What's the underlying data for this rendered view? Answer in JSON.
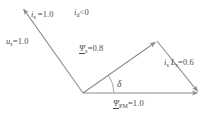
{
  "diagram": {
    "background_color": "#ffffff",
    "line_color": "#8c8c8c",
    "text_color": "#4a4a4a",
    "labels": {
      "u_s": {
        "symbol": "u",
        "subscript": "s",
        "relation": "=",
        "value": "1.0",
        "text": "u"
      },
      "i_s_top": {
        "symbol": "i",
        "subscript": "s",
        "relation": "=",
        "value": "1.0",
        "text": "i"
      },
      "i_d": {
        "symbol": "i",
        "subscript": "d",
        "relation": "<",
        "value": "0",
        "text": "i"
      },
      "psi_s": {
        "symbol": "Ψ",
        "subscript": "s",
        "relation": "=",
        "value": "0.8",
        "text": "Ψ"
      },
      "is_ls": {
        "symbol_1": "i",
        "subscript_1": "s",
        "symbol_2": "L",
        "subscript_2": "s",
        "relation": "=",
        "value": "0.6"
      },
      "psi_pm": {
        "symbol": "Ψ",
        "subscript": "PM",
        "relation": "=",
        "value": "1.0",
        "text": "Ψ"
      },
      "delta": {
        "symbol": "δ"
      }
    },
    "vectors": [
      {
        "name": "u_s",
        "from": [
          83,
          93
        ],
        "to": [
          22,
          7
        ],
        "arrow_at": "to"
      },
      {
        "name": "psi_s",
        "from": [
          83,
          93
        ],
        "to": [
          157,
          41
        ],
        "arrow_at": "to"
      },
      {
        "name": "is_ls",
        "from": [
          157,
          41
        ],
        "to": [
          199,
          93
        ],
        "arrow_at": "to"
      },
      {
        "name": "psi_pm",
        "from": [
          83,
          93
        ],
        "to": [
          199,
          93
        ],
        "arrow_at": "to"
      }
    ],
    "angle_arc": {
      "name": "delta",
      "center": [
        83,
        93
      ],
      "radius": 31,
      "from_deg": 0,
      "to_deg": 35
    }
  }
}
